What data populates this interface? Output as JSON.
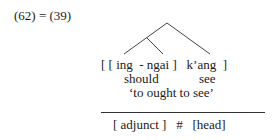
{
  "example": {
    "label": "(62) = (39)"
  },
  "gloss": {
    "line1": "[ [ ing  - ngai ]   k’ang  ]",
    "line2_left": "should",
    "line2_right": "see",
    "translation": "‘to ought to see’"
  },
  "structure": {
    "line": "[ adjunct ]   #   [head]"
  },
  "tree": {
    "nodes": [
      "root",
      "ing-ngai",
      "k'ang"
    ],
    "description": "root branches to [ing-ngai] (which itself branches) and k'ang"
  }
}
